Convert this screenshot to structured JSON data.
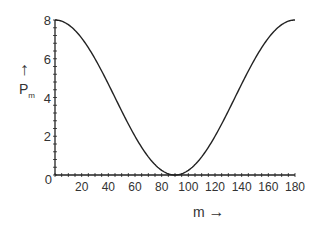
{
  "chart_data": {
    "type": "line",
    "title": "",
    "xlabel": "m →",
    "ylabel": "↑ P_m",
    "xlim": [
      0,
      180
    ],
    "ylim": [
      0,
      8
    ],
    "x_ticks": [
      "0",
      "20",
      "40",
      "60",
      "80",
      "100",
      "120",
      "140",
      "160",
      "180"
    ],
    "y_ticks": [
      "0",
      "2",
      "4",
      "6",
      "8"
    ],
    "grid": false,
    "legend": null,
    "series": [
      {
        "name": "P_m = 8 cos²(m)",
        "x": [
          0,
          10,
          20,
          30,
          40,
          50,
          60,
          70,
          80,
          90,
          100,
          110,
          120,
          130,
          140,
          150,
          160,
          170,
          180
        ],
        "values": [
          8,
          7.76,
          7.06,
          6,
          4.69,
          3.31,
          2,
          0.94,
          0.24,
          0,
          0.24,
          0.94,
          2,
          3.31,
          4.69,
          6,
          7.06,
          7.76,
          8
        ]
      }
    ],
    "line_color": "#222222"
  },
  "labels": {
    "y_arrow": "↑",
    "y_name": "P",
    "y_sub": "m",
    "x_name": "m",
    "x_arrow": "→"
  }
}
